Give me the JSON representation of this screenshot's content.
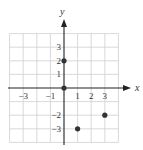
{
  "chart_data": {
    "type": "scatter",
    "title": "",
    "xlabel": "x",
    "ylabel": "y",
    "xlim": [
      -4,
      4
    ],
    "ylim": [
      -4,
      4
    ],
    "grid": true,
    "x_ticks": [
      {
        "value": -3,
        "label": "−3"
      },
      {
        "value": -1,
        "label": "−1"
      },
      {
        "value": 1,
        "label": "1"
      },
      {
        "value": 2,
        "label": "2"
      },
      {
        "value": 3,
        "label": "3"
      }
    ],
    "y_ticks": [
      {
        "value": 3,
        "label": "3"
      },
      {
        "value": 2,
        "label": "2"
      },
      {
        "value": 1,
        "label": "1"
      },
      {
        "value": -2,
        "label": "−2"
      },
      {
        "value": -3,
        "label": "−3"
      }
    ],
    "points": [
      {
        "x": 0,
        "y": 2
      },
      {
        "x": 0,
        "y": 0
      },
      {
        "x": 1,
        "y": -3
      },
      {
        "x": 3,
        "y": -2
      }
    ],
    "colors": {
      "point": "#333333",
      "grid": "#cfcfcf",
      "axis": "#222222"
    }
  }
}
